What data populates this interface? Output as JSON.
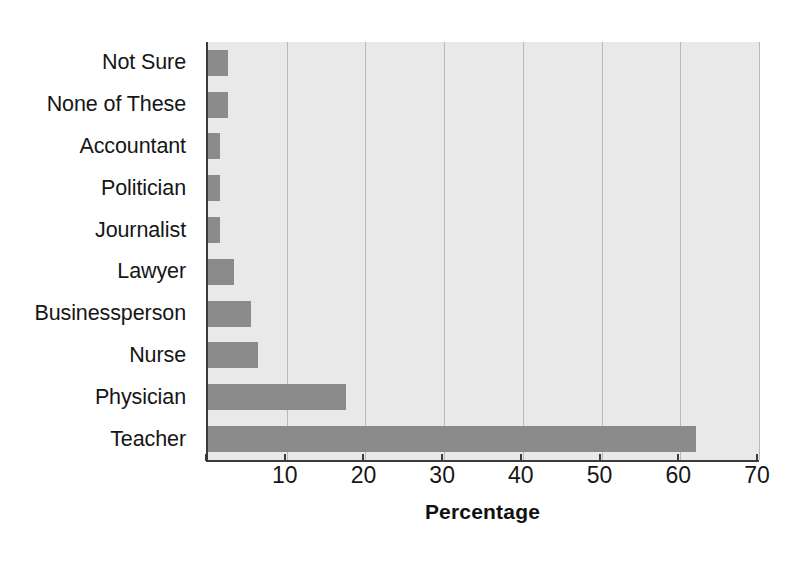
{
  "chart_data": {
    "type": "bar",
    "orientation": "horizontal",
    "title": "",
    "xlabel": "Percentage",
    "ylabel": "",
    "xlim": [
      0,
      70
    ],
    "ylim": null,
    "grid": true,
    "legend": false,
    "xticks": [
      0,
      10,
      20,
      30,
      40,
      50,
      60,
      70
    ],
    "xtick_labels": [
      "",
      "10",
      "20",
      "30",
      "40",
      "50",
      "60",
      "70"
    ],
    "categories": [
      "Not Sure",
      "None of These",
      "Accountant",
      "Politician",
      "Journalist",
      "Lawyer",
      "Businessperson",
      "Nurse",
      "Physician",
      "Teacher"
    ],
    "values": [
      2.5,
      2.5,
      1.5,
      1.5,
      1.5,
      3.3,
      5.5,
      6.4,
      17.5,
      62
    ],
    "series": [
      {
        "name": "Percentage",
        "values": [
          2.5,
          2.5,
          1.5,
          1.5,
          1.5,
          3.3,
          5.5,
          6.4,
          17.5,
          62
        ]
      }
    ],
    "colors": {
      "bar": "#8b8b8b",
      "plot_background": "#e9e9e9",
      "gridline": "#b9b9b9",
      "axis": "#3b3b3b",
      "text": "#161616",
      "figure_background": "#ffffff"
    }
  }
}
